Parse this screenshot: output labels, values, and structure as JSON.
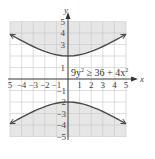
{
  "chart_data": {
    "type": "area",
    "title": "",
    "inequality": "9y² ≥ 36 + 4x²",
    "inequality_parts": {
      "lhs": "9y",
      "lhs_exp": "2",
      "op": "≥",
      "rhs": "36 + 4x",
      "rhs_exp": "2"
    },
    "xlabel": "x",
    "ylabel": "y",
    "xlim": [
      -5,
      5
    ],
    "ylim": [
      -5,
      5
    ],
    "grid": true,
    "x_ticks": [
      "5",
      "−4",
      "−3",
      "−2",
      "−1",
      "1",
      "2",
      "3",
      "4",
      "5"
    ],
    "y_ticks_positive": [
      "5",
      "4",
      "3",
      "",
      "1"
    ],
    "y_ticks_negative": [
      "−1",
      "−2",
      "−3",
      "−4",
      "−5"
    ],
    "boundary": {
      "equation": "9y² = 36 + 4x²",
      "branches": [
        {
          "name": "upper",
          "vertex": [
            0,
            2
          ],
          "endpoints": [
            [
              -5,
              3.9
            ],
            [
              5,
              3.9
            ]
          ]
        },
        {
          "name": "lower",
          "vertex": [
            0,
            -2
          ],
          "endpoints": [
            [
              -5,
              -3.9
            ],
            [
              5,
              -3.9
            ]
          ]
        }
      ],
      "line_style": "solid"
    },
    "shaded_regions": [
      "above upper branch",
      "below lower branch"
    ],
    "colors": {
      "shade": "#e6e6e6",
      "grid": "#c8c8c8",
      "curve": "#4a4a4a",
      "axis": "#333333"
    }
  }
}
